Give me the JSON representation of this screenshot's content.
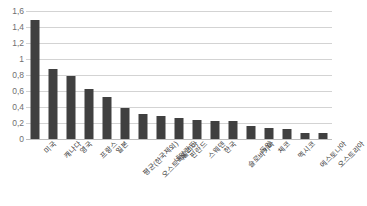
{
  "chart_data": {
    "type": "bar",
    "title": "",
    "subtitle": "",
    "xlabel": "",
    "ylabel": "",
    "ylim": [
      0,
      1.6
    ],
    "grid": true,
    "legend": false,
    "decimal_separator": ",",
    "bar_color": "#404040",
    "gridline_color": "#d3d3d3",
    "categories": [
      "미국",
      "캐나다",
      "영국",
      "프랑스",
      "일본",
      "평균(한국제외)",
      "오스트레일리아",
      "네덜란드",
      "핀란드",
      "스웨덴",
      "한국",
      "슬로바키아",
      "독일",
      "체코",
      "멕시코",
      "에스토니아",
      "오스트리아"
    ],
    "values": [
      1.49,
      0.87,
      0.79,
      0.62,
      0.53,
      0.39,
      0.31,
      0.29,
      0.26,
      0.24,
      0.23,
      0.22,
      0.16,
      0.14,
      0.13,
      0.08,
      0.07
    ],
    "ytick_labels": [
      "0",
      "0,2",
      "0,4",
      "0,6",
      "0,8",
      "1",
      "1,2",
      "1,4",
      "1,6"
    ],
    "ytick_values": [
      0,
      0.2,
      0.4,
      0.6,
      0.8,
      1.0,
      1.2,
      1.4,
      1.6
    ]
  }
}
